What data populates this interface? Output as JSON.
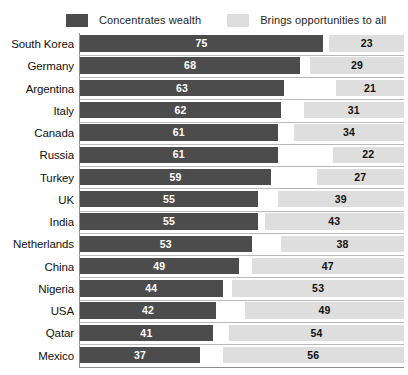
{
  "legend": {
    "items": [
      {
        "label": "Concentrates wealth",
        "color": "#4c4c4c",
        "icon": "legend-swatch-icon"
      },
      {
        "label": "Brings opportunities to all",
        "color": "#dedede",
        "icon": "legend-swatch-icon"
      }
    ]
  },
  "chart_data": {
    "type": "bar",
    "title": "",
    "subtitle": "",
    "xlabel": "",
    "ylabel": "",
    "orientation": "horizontal",
    "stacked": false,
    "grid": false,
    "legend_position": "top",
    "xlim": [
      0,
      100
    ],
    "categories": [
      "South Korea",
      "Germany",
      "Argentina",
      "Italy",
      "Canada",
      "Russia",
      "Turkey",
      "UK",
      "India",
      "Netherlands",
      "China",
      "Nigeria",
      "USA",
      "Qatar",
      "Mexico"
    ],
    "series": [
      {
        "name": "Concentrates wealth",
        "color": "#4c4c4c",
        "values": [
          75,
          68,
          63,
          62,
          61,
          61,
          59,
          55,
          55,
          53,
          49,
          44,
          42,
          41,
          37
        ]
      },
      {
        "name": "Brings opportunities to all",
        "color": "#dedede",
        "values": [
          23,
          29,
          21,
          31,
          34,
          22,
          27,
          39,
          43,
          38,
          47,
          53,
          49,
          54,
          56
        ]
      }
    ]
  }
}
